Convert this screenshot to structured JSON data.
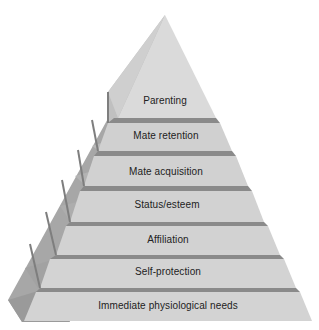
{
  "diagram": {
    "type": "pyramid",
    "title": "",
    "tiers_top_to_bottom": [
      {
        "label": "Parenting",
        "center_x": 165,
        "label_y": 101
      },
      {
        "label": "Mate retention",
        "center_x": 166,
        "label_y": 131
      },
      {
        "label": "Mate acquisition",
        "center_x": 166,
        "label_y": 166
      },
      {
        "label": "Status/esteem",
        "center_x": 167,
        "label_y": 200
      },
      {
        "label": "Affiliation",
        "center_x": 168,
        "label_y": 234
      },
      {
        "label": "Self-protection",
        "center_x": 168,
        "label_y": 266
      },
      {
        "label": "Immediate physiological needs",
        "center_x": 168,
        "label_y": 299
      }
    ],
    "colors": {
      "front_face": "#d2d2d2",
      "apex_light": "#dcdcdc",
      "apex_shade": "#c9c9c9",
      "step_strip": "#8a8a8a",
      "side_face": "#a9a9a9",
      "side_dark": "#8f8f8f",
      "text": "#222222"
    }
  }
}
